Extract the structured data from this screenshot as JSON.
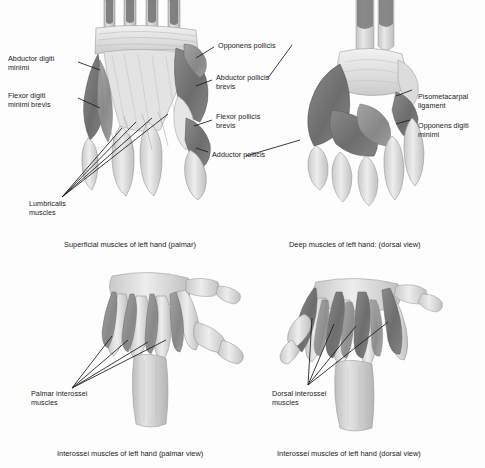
{
  "figure": {
    "background_color": "#fdfdfd",
    "line_color": "#1a1a1a",
    "muscle_dark": "#6f6f6f",
    "muscle_mid": "#8e8e8e",
    "bone_light": "#cfcfcf",
    "tendon_light": "#e9e9e9"
  },
  "panels": [
    {
      "id": "superficial-palmar",
      "caption": "Superficial muscles of left hand (palmar)",
      "labels": [
        {
          "id": "abductor-digiti-minimi",
          "text": "Abductor digiti\nminimi"
        },
        {
          "id": "flexor-digiti-minimi-brevis",
          "text": "Flexor digiti\nminimi brevis"
        },
        {
          "id": "lumbricalis-muscles",
          "text": "Lumbricalis\nmuscles"
        },
        {
          "id": "opponens-pollicis",
          "text": "Opponens pollicis"
        },
        {
          "id": "abductor-pollicis-brevis",
          "text": "Abductor pollicis\nbrevis"
        },
        {
          "id": "flexor-pollicis-brevis",
          "text": "Flexor pollicis\nbrevis"
        },
        {
          "id": "adductor-pollicis",
          "text": "Adductor pollicis"
        }
      ]
    },
    {
      "id": "deep-dorsal",
      "caption": "Deep muscles of left hand: (dorsal view)",
      "labels": [
        {
          "id": "pisometacarpal-ligament",
          "text": "Pisometacarpal\nligament"
        },
        {
          "id": "opponens-digiti-minimi",
          "text": "Opponens digiti\nminimi"
        }
      ]
    },
    {
      "id": "interossei-palmar",
      "caption": "Interossei muscles of left hand (palmar view)",
      "labels": [
        {
          "id": "palmar-interossei-muscles",
          "text": "Palmar interossei\nmuscles"
        }
      ]
    },
    {
      "id": "interossei-dorsal",
      "caption": "Interossei muscles of left hand (dorsal view)",
      "labels": [
        {
          "id": "dorsal-interossei-muscles",
          "text": "Dorsal interossei\nmuscles"
        }
      ]
    }
  ]
}
